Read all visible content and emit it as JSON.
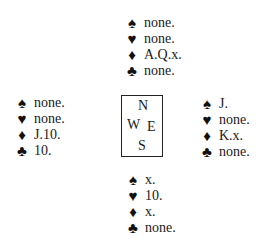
{
  "suits": {
    "spade": "♠",
    "heart": "♥",
    "diamond": "♦",
    "club": "♣"
  },
  "compass": {
    "north": "N",
    "west": "W",
    "east": "E",
    "south": "S"
  },
  "hands": {
    "north": {
      "spades": "none.",
      "hearts": "none.",
      "diamonds": "A.Q.x.",
      "clubs": "none."
    },
    "west": {
      "spades": "none.",
      "hearts": "none.",
      "diamonds": "J.10.",
      "clubs": "10."
    },
    "east": {
      "spades": "J.",
      "hearts": "none.",
      "diamonds": "K.x.",
      "clubs": "none."
    },
    "south": {
      "spades": "x.",
      "hearts": "10.",
      "diamonds": "x.",
      "clubs": "none."
    }
  }
}
